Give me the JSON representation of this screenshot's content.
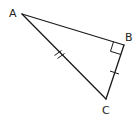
{
  "diagram": {
    "type": "right-triangle",
    "stroke_color": "#1a1a1a",
    "vertices": {
      "A": {
        "label": "A",
        "x": 22,
        "y": 14
      },
      "B": {
        "label": "B",
        "x": 124,
        "y": 45
      },
      "C": {
        "label": "C",
        "x": 106,
        "y": 99
      }
    },
    "right_angle_at": "B",
    "tick_marks": [
      {
        "segment": "AC",
        "count": 2
      },
      {
        "segment": "BC",
        "count": 1
      }
    ]
  }
}
